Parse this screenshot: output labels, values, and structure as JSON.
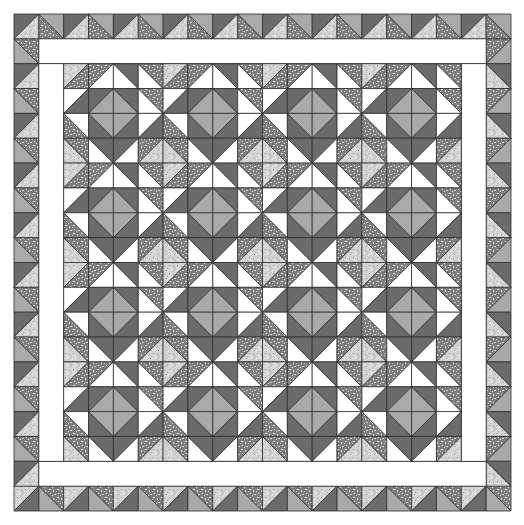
{
  "quilt": {
    "origin": 14,
    "cell": 24.85,
    "outer_border_cells": 20,
    "inner_border_width_cells": 1,
    "center_blocks": 4,
    "block_cells": 4,
    "colors": {
      "W": "#ffffff",
      "D": "#6b6b6b",
      "M": "#a9a9a9",
      "LS": "#d2d2d2",
      "DS": "#8c8c8c",
      "line": "#2e2e2e"
    },
    "block": [
      [
        [
          "/",
          "LS",
          "DS"
        ],
        [
          "/",
          "DS",
          "W"
        ],
        [
          "\\",
          "W",
          "D"
        ],
        [
          "\\",
          "W",
          "DS"
        ]
      ],
      [
        [
          "/",
          "W",
          "D"
        ],
        [
          "/",
          "D",
          "M"
        ],
        [
          "\\",
          "M",
          "D"
        ],
        [
          "\\",
          "W",
          "DS"
        ]
      ],
      [
        [
          "\\",
          "DS",
          "W"
        ],
        [
          "\\",
          "D",
          "M"
        ],
        [
          "/",
          "M",
          "D"
        ],
        [
          "/",
          "W",
          "D"
        ]
      ],
      [
        [
          "\\",
          "LS",
          "DS"
        ],
        [
          "\\",
          "W",
          "D"
        ],
        [
          "/",
          "D",
          "W"
        ],
        [
          "/",
          "DS",
          "LS"
        ]
      ]
    ],
    "borders": {
      "top": [
        [
          "/",
          "D",
          "LS"
        ],
        [
          "\\",
          "DS",
          "M"
        ]
      ],
      "right": [
        [
          "\\",
          "LS",
          "D"
        ],
        [
          "/",
          "DS",
          "M"
        ]
      ],
      "bottom": [
        [
          "/",
          "LS",
          "D"
        ],
        [
          "\\",
          "M",
          "DS"
        ]
      ],
      "left": [
        [
          "\\",
          "M",
          "DS"
        ],
        [
          "/",
          "D",
          "LS"
        ]
      ]
    },
    "cell_format_note": "[diagonal, colorA, colorB]; '/' = bottom-left to top-right (A upper-left, B lower-right); '\\' = top-left to bottom-right (A lower-left, B upper-right)"
  }
}
